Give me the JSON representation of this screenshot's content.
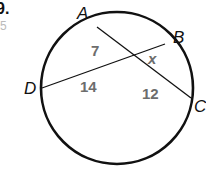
{
  "problem": {
    "number_fragment": "9.",
    "side_fragment": "5"
  },
  "diagram": {
    "points": {
      "A": "A",
      "B": "B",
      "C": "C",
      "D": "D"
    },
    "segments": {
      "AE": "7",
      "EB": "x",
      "DE": "14",
      "EC": "12"
    },
    "colors": {
      "stroke": "#111111",
      "label": "#6d6d6d"
    }
  }
}
